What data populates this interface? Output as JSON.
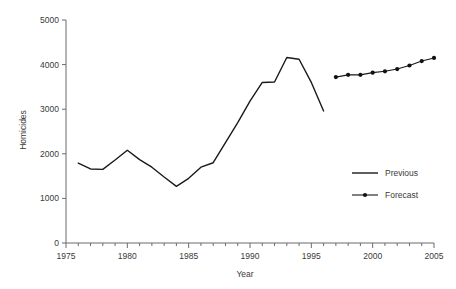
{
  "chart_data": {
    "type": "line",
    "title": "",
    "xlabel": "Year",
    "ylabel": "Homicides",
    "xlim": [
      1975,
      2005
    ],
    "ylim": [
      0,
      5000
    ],
    "grid": false,
    "legend_position": "inside-right",
    "xticks": [
      1975,
      1976,
      1977,
      1978,
      1979,
      1980,
      1981,
      1982,
      1983,
      1984,
      1985,
      1986,
      1987,
      1988,
      1989,
      1990,
      1991,
      1992,
      1993,
      1994,
      1995,
      1996,
      1997,
      1998,
      1999,
      2000,
      2001,
      2002,
      2003,
      2004,
      2005
    ],
    "xtick_labels": [
      "1975",
      "",
      "",
      "",
      "",
      "1980",
      "",
      "",
      "",
      "",
      "1985",
      "",
      "",
      "",
      "",
      "1990",
      "",
      "",
      "",
      "",
      "1995",
      "",
      "",
      "",
      "",
      "2000",
      "",
      "",
      "",
      "",
      "2005"
    ],
    "yticks": [
      0,
      1000,
      2000,
      3000,
      4000,
      5000
    ],
    "ytick_labels": [
      "0",
      "1000",
      "2000",
      "3000",
      "4000",
      "5000"
    ],
    "series": [
      {
        "name": "Previous",
        "marker": "none",
        "x": [
          1976,
          1977,
          1978,
          1979,
          1980,
          1981,
          1982,
          1983,
          1984,
          1985,
          1986,
          1987,
          1988,
          1989,
          1990,
          1991,
          1992,
          1993,
          1994,
          1995,
          1996
        ],
        "values": [
          1790,
          1660,
          1650,
          1860,
          2080,
          1870,
          1700,
          1480,
          1270,
          1450,
          1700,
          1800,
          2250,
          2700,
          3180,
          3600,
          3610,
          4160,
          4120,
          3600,
          2960
        ]
      },
      {
        "name": "Forecast",
        "marker": "circle",
        "x": [
          1997,
          1998,
          1999,
          2000,
          2001,
          2002,
          2003,
          2004,
          2005
        ],
        "values": [
          3720,
          3770,
          3770,
          3820,
          3850,
          3900,
          3980,
          4080,
          4150
        ]
      }
    ]
  },
  "legend": {
    "items": [
      {
        "label": "Previous"
      },
      {
        "label": "Forecast"
      }
    ]
  },
  "axes": {
    "x_title": "Year",
    "y_title": "Homicides"
  },
  "colors": {
    "series_line": "#1a1a1a",
    "axis": "#6b6b6b",
    "text": "#3a3a3a",
    "background": "#ffffff"
  }
}
